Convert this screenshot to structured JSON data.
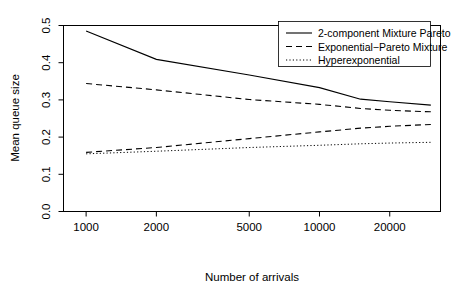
{
  "chart_data": {
    "type": "line",
    "title": "",
    "subtitle": "",
    "xlabel": "Number of arrivals",
    "ylabel": "Mean queue size",
    "xscale": "log",
    "yscale": "linear",
    "xlim": [
      800,
      33000
    ],
    "ylim": [
      0.0,
      0.5
    ],
    "grid": false,
    "legend_position": "top-right",
    "xticks": [
      1000,
      2000,
      5000,
      10000,
      20000
    ],
    "xtick_labels": [
      "1000",
      "2000",
      "5000",
      "10000",
      "20000"
    ],
    "yticks": [
      0.0,
      0.1,
      0.2,
      0.3,
      0.4,
      0.5
    ],
    "ytick_labels": [
      "0.0",
      "0.1",
      "0.2",
      "0.3",
      "0.4",
      "0.5"
    ],
    "x": [
      1000,
      2000,
      5000,
      10000,
      15000,
      20000,
      30000
    ],
    "series": [
      {
        "name": "2-component Mixture Pareto",
        "style": "solid",
        "color": "#000000",
        "values": [
          0.485,
          0.409,
          0.367,
          0.333,
          0.302,
          0.295,
          0.286
        ]
      },
      {
        "name": "Exponential−Pareto Mixture",
        "style": "dashed",
        "color": "#000000",
        "values": [
          0.344,
          0.327,
          0.301,
          0.288,
          0.277,
          0.272,
          0.268
        ]
      },
      {
        "name": "Hyperexponential",
        "style": "dotted",
        "color": "#000000",
        "values": [
          0.155,
          0.162,
          0.172,
          0.178,
          0.182,
          0.184,
          0.186
        ]
      },
      {
        "name": "Exponential−Pareto Mixture Lower",
        "style": "dashed",
        "color": "#000000",
        "hidden_from_legend": true,
        "values": [
          0.159,
          0.172,
          0.196,
          0.214,
          0.224,
          0.229,
          0.234
        ]
      }
    ]
  },
  "legend": {
    "items": [
      {
        "label": "2-component Mixture Pareto",
        "style": "solid"
      },
      {
        "label": "Exponential−Pareto Mixture",
        "style": "dashed"
      },
      {
        "label": "Hyperexponential",
        "style": "dotted"
      }
    ]
  },
  "axes": {
    "x_title": "Number of arrivals",
    "y_title": "Mean queue size"
  },
  "colors": {
    "foreground": "#000000",
    "background": "#ffffff"
  }
}
